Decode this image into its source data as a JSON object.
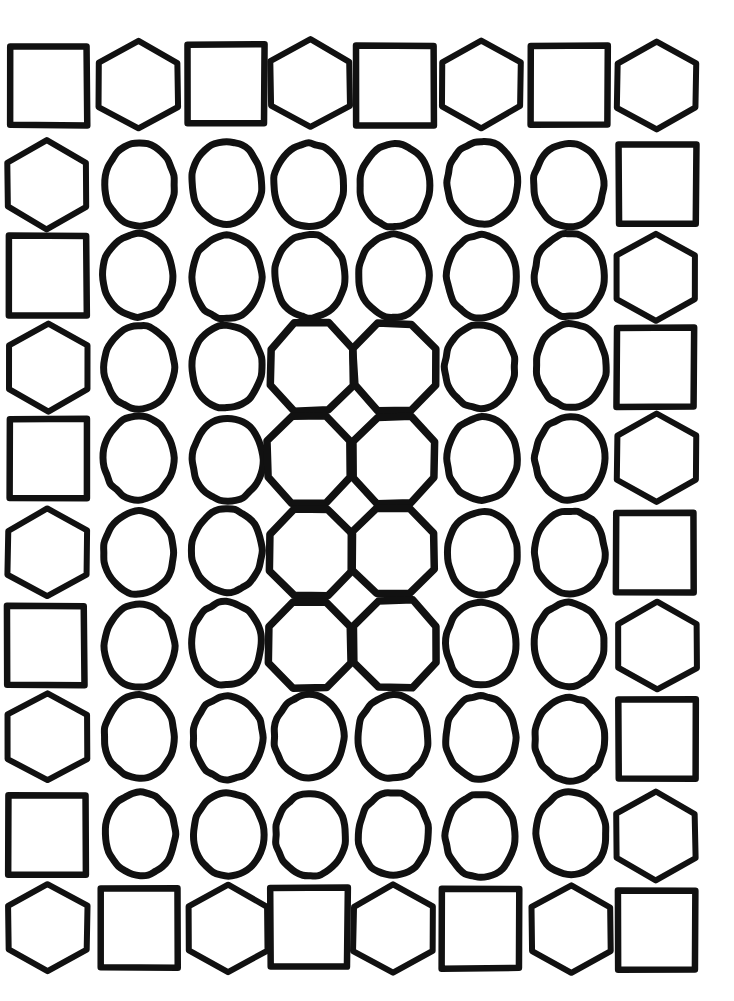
{
  "canvas": {
    "width": 734,
    "height": 1001,
    "background": "#ffffff",
    "stroke_color": "#111111",
    "description": "Hand-drawn style grid of outlined geometric shapes, 8 columns by 10 rows"
  },
  "grid": {
    "columns": 8,
    "rows": 10,
    "column_centers": [
      47,
      139,
      227,
      310,
      394,
      481,
      570,
      656
    ],
    "row_centers": [
      85,
      184,
      276,
      366,
      459,
      552,
      645,
      738,
      835,
      929
    ],
    "cell_width": 78,
    "cell_height": 80
  },
  "shape_styles": {
    "square": {
      "name": "square",
      "sides": 4,
      "rotation": 45,
      "stroke_width": 6.5,
      "rx": 0.5,
      "ry": 0.5
    },
    "hexagon": {
      "name": "hexagon",
      "sides": 6,
      "rotation": 0,
      "stroke_width": 6.0,
      "rx": 0.54,
      "ry": 0.5
    },
    "octagon": {
      "name": "octagon",
      "sides": 8,
      "rotation": 22.5,
      "stroke_width": 7.5,
      "rx": 0.53,
      "ry": 0.55
    },
    "circle": {
      "name": "circle",
      "sides": 0,
      "rotation": 0,
      "stroke_width": 7.0,
      "rx": 0.45,
      "ry": 0.52
    }
  },
  "chart_data": {
    "type": "heatmap",
    "title": "",
    "xlabel": "",
    "ylabel": "",
    "legend": [
      "square",
      "hexagon",
      "circle",
      "octagon"
    ],
    "categories": [
      "c1",
      "c2",
      "c3",
      "c4",
      "c5",
      "c6",
      "c7",
      "c8"
    ],
    "rows": [
      {
        "index": 1,
        "cells": [
          "square",
          "hexagon",
          "square",
          "hexagon",
          "square",
          "hexagon",
          "square",
          "hexagon"
        ]
      },
      {
        "index": 2,
        "cells": [
          "hexagon",
          "circle",
          "circle",
          "circle",
          "circle",
          "circle",
          "circle",
          "square"
        ]
      },
      {
        "index": 3,
        "cells": [
          "square",
          "circle",
          "circle",
          "circle",
          "circle",
          "circle",
          "circle",
          "hexagon"
        ]
      },
      {
        "index": 4,
        "cells": [
          "hexagon",
          "circle",
          "circle",
          "octagon",
          "octagon",
          "circle",
          "circle",
          "square"
        ]
      },
      {
        "index": 5,
        "cells": [
          "square",
          "circle",
          "circle",
          "octagon",
          "octagon",
          "circle",
          "circle",
          "hexagon"
        ]
      },
      {
        "index": 6,
        "cells": [
          "hexagon",
          "circle",
          "circle",
          "octagon",
          "octagon",
          "circle",
          "circle",
          "square"
        ]
      },
      {
        "index": 7,
        "cells": [
          "square",
          "circle",
          "circle",
          "octagon",
          "octagon",
          "circle",
          "circle",
          "hexagon"
        ]
      },
      {
        "index": 8,
        "cells": [
          "hexagon",
          "circle",
          "circle",
          "circle",
          "circle",
          "circle",
          "circle",
          "square"
        ]
      },
      {
        "index": 9,
        "cells": [
          "square",
          "circle",
          "circle",
          "circle",
          "circle",
          "circle",
          "circle",
          "hexagon"
        ]
      },
      {
        "index": 10,
        "cells": [
          "hexagon",
          "square",
          "hexagon",
          "square",
          "hexagon",
          "square",
          "hexagon",
          "square"
        ]
      }
    ],
    "counts": {
      "square": 18,
      "hexagon": 18,
      "circle": 36,
      "octagon": 8
    }
  }
}
